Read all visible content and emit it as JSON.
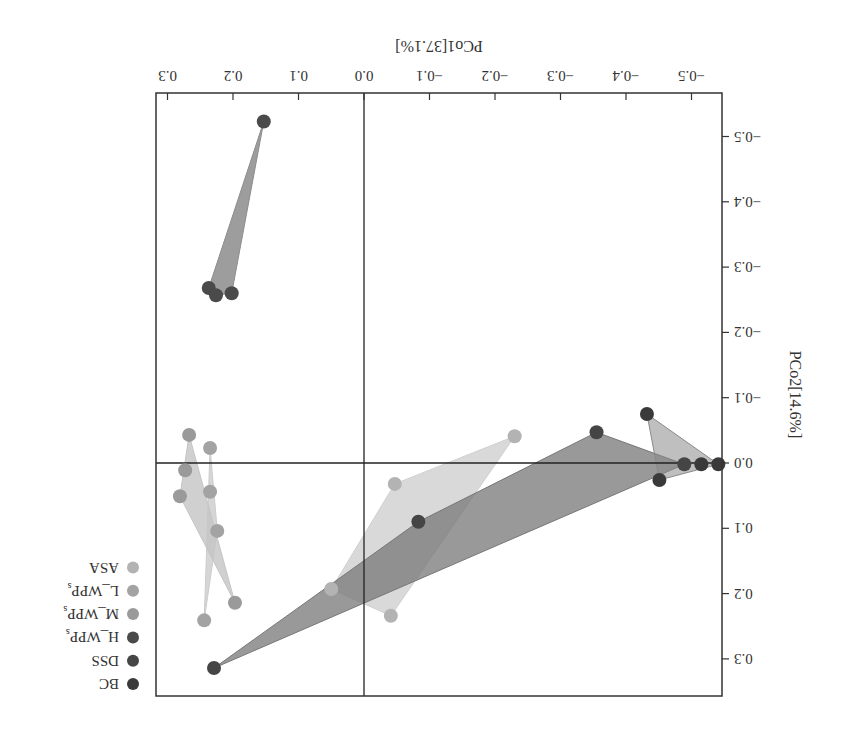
{
  "chart_data": {
    "type": "scatter",
    "title": "",
    "rotation_deg": 180,
    "xlabel": "PCo1[37.1%]",
    "ylabel": "PCo2[14.6%]",
    "xlim": [
      -0.53,
      0.32
    ],
    "ylim": [
      -0.56,
      0.36
    ],
    "xticks": [
      -0.5,
      -0.4,
      -0.3,
      -0.2,
      -0.1,
      0.0,
      0.1,
      0.2,
      0.3
    ],
    "xtick_labels": [
      "−0.5",
      "−0.4",
      "−0.3",
      "−0.2",
      "−0.1",
      "0.0",
      "0.1",
      "0.2",
      "0.3"
    ],
    "yticks": [
      -0.5,
      -0.4,
      -0.3,
      -0.2,
      -0.1,
      0.0,
      0.1,
      0.2,
      0.3
    ],
    "ytick_labels": [
      "−0.5",
      "−0.4",
      "−0.3",
      "−0.2",
      "−0.1",
      "0.0",
      "0.1",
      "0.2",
      "0.3"
    ],
    "reference_lines": {
      "x": 0.0,
      "y": 0.0
    },
    "grid": false,
    "legend_position": "right",
    "series": [
      {
        "name": "BC",
        "color": "#3a3a3a",
        "hull_color": "#8a8a8a",
        "hull_opacity": 0.55,
        "points": [
          [
            -0.432,
            -0.075
          ],
          [
            -0.515,
            0.002
          ],
          [
            -0.541,
            0.002
          ],
          [
            -0.451,
            0.026
          ]
        ]
      },
      {
        "name": "DSS",
        "color": "#454545",
        "hull_color": "#777777",
        "hull_opacity": 0.75,
        "points": [
          [
            0.229,
            0.314
          ],
          [
            -0.083,
            0.09
          ],
          [
            -0.355,
            -0.047
          ],
          [
            -0.489,
            0.002
          ]
        ]
      },
      {
        "name": "H_WPPs",
        "color": "#4a4a4a",
        "hull_color": "#8c8c8c",
        "hull_opacity": 0.85,
        "points": [
          [
            0.153,
            -0.523
          ],
          [
            0.237,
            -0.268
          ],
          [
            0.226,
            -0.257
          ],
          [
            0.202,
            -0.26
          ]
        ]
      },
      {
        "name": "M_WPPs",
        "color": "#9a9a9a",
        "hull_color": "#c4c4c4",
        "hull_opacity": 0.8,
        "points": [
          [
            0.267,
            -0.043
          ],
          [
            0.273,
            0.011
          ],
          [
            0.281,
            0.051
          ],
          [
            0.197,
            0.214
          ]
        ]
      },
      {
        "name": "L_WPPs",
        "color": "#a3a3a3",
        "hull_color": "#cccccc",
        "hull_opacity": 0.8,
        "points": [
          [
            0.235,
            -0.023
          ],
          [
            0.235,
            0.044
          ],
          [
            0.224,
            0.104
          ],
          [
            0.244,
            0.241
          ]
        ]
      },
      {
        "name": "ASA",
        "color": "#b3b3b3",
        "hull_color": "#cfcfcf",
        "hull_opacity": 0.8,
        "points": [
          [
            -0.23,
            -0.041
          ],
          [
            -0.047,
            0.032
          ],
          [
            0.05,
            0.193
          ],
          [
            -0.041,
            0.234
          ]
        ]
      }
    ]
  },
  "legend": {
    "items": [
      {
        "label": "ASA",
        "color": "#b3b3b3"
      },
      {
        "label": "L_WPPs",
        "color": "#a3a3a3"
      },
      {
        "label": "M_WPPs",
        "color": "#9a9a9a"
      },
      {
        "label": "H_WPPs",
        "color": "#4a4a4a"
      },
      {
        "label": "DSS",
        "color": "#454545"
      },
      {
        "label": "BC",
        "color": "#3a3a3a"
      }
    ]
  }
}
